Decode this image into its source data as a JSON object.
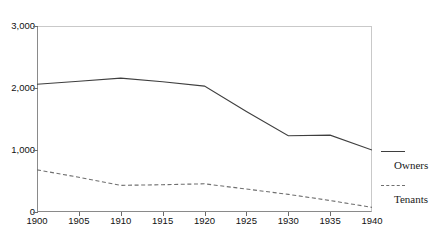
{
  "title_fragment": "·   ··   ·   ··   ··",
  "axes": {
    "y_ticks": [
      "3,000",
      "2,000",
      "1,000",
      "0"
    ],
    "x_ticks": [
      "1900",
      "1905",
      "1910",
      "1915",
      "1920",
      "1925",
      "1930",
      "1935",
      "1940"
    ]
  },
  "legend": {
    "entries": [
      {
        "label": "Owners",
        "style": "solid",
        "color": "#3f3f3f"
      },
      {
        "label": "Tenants",
        "style": "dashed",
        "color": "#6f6f6f"
      }
    ]
  },
  "chart_data": {
    "type": "line",
    "title": "",
    "xlabel": "",
    "ylabel": "",
    "x": [
      1900,
      1905,
      1910,
      1915,
      1920,
      1925,
      1930,
      1935,
      1940
    ],
    "xlim": [
      1900,
      1940
    ],
    "ylim": [
      0,
      3000
    ],
    "y_tick_values": [
      0,
      1000,
      2000,
      3000
    ],
    "x_tick_values": [
      1900,
      1905,
      1910,
      1915,
      1920,
      1925,
      1930,
      1935,
      1940
    ],
    "grid": false,
    "legend_position": "right",
    "series": [
      {
        "name": "Owners",
        "style": "solid",
        "color": "#3f3f3f",
        "values": [
          2060,
          2110,
          2160,
          2100,
          2030,
          1620,
          1230,
          1240,
          1000
        ]
      },
      {
        "name": "Tenants",
        "style": "dashed",
        "color": "#6f6f6f",
        "values": [
          680,
          560,
          430,
          440,
          455,
          370,
          285,
          185,
          75
        ]
      }
    ]
  }
}
